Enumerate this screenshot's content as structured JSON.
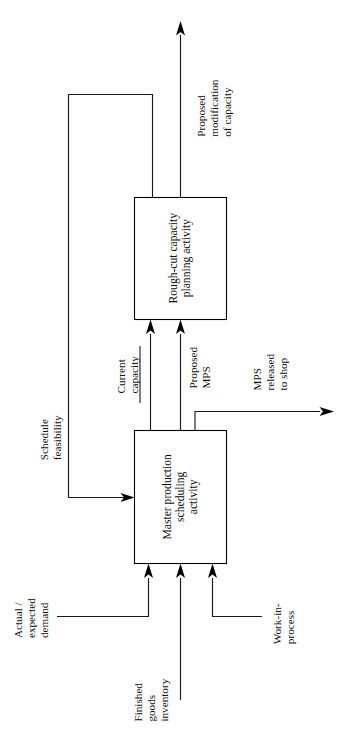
{
  "diagram": {
    "orientation": "rotated-90-ccw",
    "colors": {
      "background": "#ffffff",
      "line": "#1a1a1a",
      "box_stroke": "#000000",
      "box_fill": "#ffffff",
      "text": "#0d0d0d"
    },
    "boxes": [
      {
        "id": "rough-cut",
        "label": "Rough-cut capacity\nplanning activity",
        "lines": [
          "Rough-cut capacity",
          "planning activity"
        ]
      },
      {
        "id": "mps",
        "label": "Master production\nscheduling\nactivity",
        "lines": [
          "Master production",
          "scheduling",
          "activity"
        ]
      }
    ],
    "labels": [
      {
        "id": "proposed-modification",
        "text": "Proposed\nmodification\nof capacity",
        "lines": [
          "Proposed",
          "modification",
          "of capacity"
        ]
      },
      {
        "id": "current-capacity",
        "text": "Current\ncapacity",
        "lines": [
          "Current",
          "capacity"
        ],
        "underlined": true
      },
      {
        "id": "proposed-mps",
        "text": "Proposed\nMPS",
        "lines": [
          "Proposed",
          "MPS"
        ]
      },
      {
        "id": "mps-released",
        "text": "MPS\nreleased\nto shop",
        "lines": [
          "MPS",
          "released",
          "to shop"
        ]
      },
      {
        "id": "schedule-feasibility",
        "text": "Schedule\nfeasibility",
        "lines": [
          "Schedule",
          "feasibility"
        ]
      },
      {
        "id": "actual-expected-demand",
        "text": "Actual /\nexpected\ndemand",
        "lines": [
          "Actual /",
          "expected",
          "demand"
        ]
      },
      {
        "id": "finished-goods-inventory",
        "text": "Finished\ngoods\ninventory",
        "lines": [
          "Finished",
          "goods",
          "inventory"
        ]
      },
      {
        "id": "work-in-process",
        "text": "Work-in-\nprocess",
        "lines": [
          "Work-in-",
          "process"
        ]
      }
    ]
  }
}
